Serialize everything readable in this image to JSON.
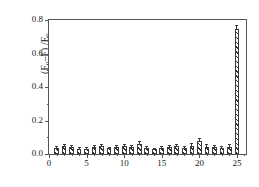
{
  "chart_data": {
    "type": "bar",
    "title": "",
    "subtitle": "",
    "xlabel": "",
    "ylabel": "(F0-F) /F0",
    "ylabel_parts": {
      "prefix": "(F",
      "sub1": "0",
      "mid": "–F) /F",
      "sub2": "0"
    },
    "xlim": [
      0,
      26.2
    ],
    "ylim": [
      0.0,
      0.8
    ],
    "grid": false,
    "legend": null,
    "frame": true,
    "bar_fill": "hatched-diagonal",
    "bar_edge_color": "#3a3a3a",
    "bar_face_color": "#ffffff",
    "categories": [
      1,
      2,
      3,
      4,
      5,
      6,
      7,
      8,
      9,
      10,
      11,
      12,
      13,
      14,
      15,
      16,
      17,
      18,
      19,
      20,
      21,
      22,
      23,
      24,
      25
    ],
    "values": [
      0.038,
      0.049,
      0.041,
      0.03,
      0.031,
      0.041,
      0.048,
      0.033,
      0.04,
      0.048,
      0.043,
      0.061,
      0.034,
      0.027,
      0.034,
      0.042,
      0.047,
      0.036,
      0.049,
      0.078,
      0.044,
      0.04,
      0.038,
      0.044,
      0.745
    ],
    "errors": [
      0.006,
      0.007,
      0.006,
      0.005,
      0.005,
      0.006,
      0.007,
      0.005,
      0.006,
      0.007,
      0.006,
      0.012,
      0.006,
      0.005,
      0.006,
      0.006,
      0.007,
      0.006,
      0.008,
      0.013,
      0.007,
      0.006,
      0.006,
      0.007,
      0.022
    ],
    "xticks": [
      0,
      5,
      10,
      15,
      20,
      25
    ],
    "xtick_labels": [
      "0",
      "5",
      "10",
      "15",
      "20",
      "25"
    ],
    "xminor_ticks": [
      1,
      2,
      3,
      4,
      6,
      7,
      8,
      9,
      11,
      12,
      13,
      14,
      16,
      17,
      18,
      19,
      21,
      22,
      23,
      24,
      26
    ],
    "yticks": [
      0.0,
      0.2,
      0.4,
      0.6,
      0.8
    ],
    "ytick_labels": [
      "0.0",
      "0.2",
      "0.4",
      "0.6",
      "0.8"
    ],
    "yminor_ticks": [
      0.1,
      0.3,
      0.5,
      0.7
    ]
  }
}
